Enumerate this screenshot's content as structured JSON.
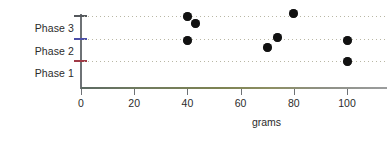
{
  "chart_data": {
    "type": "scatter",
    "title": "",
    "xlabel": "grams",
    "ylabel": "",
    "xlim": [
      0,
      115
    ],
    "ylim": [
      0,
      3.4
    ],
    "grid": true,
    "legend": false,
    "xticks": [
      0,
      20,
      40,
      60,
      80,
      100
    ],
    "xtick_labels": [
      "0",
      "20",
      "40",
      "60",
      "80",
      "100"
    ],
    "ycategories": [
      "Phase 1",
      "Phase 2",
      "Phase 3"
    ],
    "ytick_labels": [
      "Phase 1",
      "Phase 2",
      "Phase 3"
    ],
    "marker": "filled-circle",
    "marker_color": "#111111",
    "points": [
      {
        "x": 40,
        "y": 3.0,
        "phase": "Phase 3"
      },
      {
        "x": 43,
        "y": 2.7,
        "phase": "Phase 3"
      },
      {
        "x": 80,
        "y": 3.1,
        "phase": "Phase 3"
      },
      {
        "x": 40,
        "y": 2.0,
        "phase": "Phase 2"
      },
      {
        "x": 70,
        "y": 1.7,
        "phase": "Phase 2"
      },
      {
        "x": 74,
        "y": 2.1,
        "phase": "Phase 2"
      },
      {
        "x": 100,
        "y": 2.0,
        "phase": "Phase 2"
      },
      {
        "x": 100,
        "y": 1.1,
        "phase": "Phase 1"
      }
    ]
  },
  "axes": {
    "x_title": "grams",
    "x_tick_labels": [
      "0",
      "20",
      "40",
      "60",
      "80",
      "100"
    ],
    "y_tick_labels": {
      "phase3": "Phase 3",
      "phase2": "Phase 2",
      "phase1": "Phase 1"
    }
  },
  "colors": {
    "marker": "#111111",
    "y_axis_spine": "#6e7276",
    "x_axis_spine": "#7d8352",
    "tick_top": "#54585c",
    "tick_mid": "#4b4ea8",
    "tick_low": "#a03a46",
    "gridline": "#b9b7a4",
    "background": "#ffffff",
    "text": "#2b2b2b"
  }
}
